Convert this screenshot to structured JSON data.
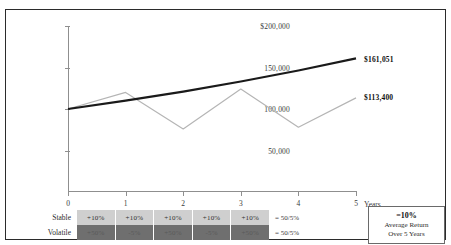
{
  "top_stub_text": "",
  "chart_data": {
    "type": "line",
    "title": "",
    "xlabel": "Years",
    "ylabel": "",
    "x": [
      0,
      1,
      2,
      3,
      4,
      5
    ],
    "xlim": [
      0,
      5
    ],
    "ylim": [
      0,
      200000
    ],
    "grid": false,
    "legend_position": "inline-right",
    "x_tick_labels": [
      "0",
      "1",
      "2",
      "3",
      "4",
      "5"
    ],
    "y_tick_labels": [
      "$200,000",
      "150,000",
      "100,000",
      "50,000"
    ],
    "y_tick_values": [
      200000,
      150000,
      100000,
      50000
    ],
    "series": [
      {
        "name": "Stable",
        "color": "#1a1a1a",
        "values": [
          100000,
          110000,
          121000,
          133100,
          146410,
          161051
        ],
        "end_label": "$161,051",
        "rates": [
          "+10%",
          "+10%",
          "+10%",
          "+10%",
          "+10%"
        ],
        "legend_note": "= 50/5%"
      },
      {
        "name": "Volatile",
        "color": "#b5b5b5",
        "values": [
          100000,
          120000,
          76000,
          124000,
          78000,
          113400
        ],
        "end_label": "$113,400",
        "rates": [
          "+50%",
          "-5%",
          "+50%",
          "-5%",
          "+50%"
        ],
        "legend_note": "= 50/5%"
      }
    ]
  },
  "table": {
    "rows": [
      {
        "label": "Stable",
        "cells": [
          "+10%",
          "+10%",
          "+10%",
          "+10%",
          "+10%"
        ],
        "legend": "= 50/5%"
      },
      {
        "label": "Volatile",
        "cells": [
          "+50%",
          "-5%",
          "+50%",
          "-5%",
          "+50%"
        ],
        "legend": "= 50/5%"
      }
    ]
  },
  "callout": {
    "headline": "=10%",
    "line1": "Average Return",
    "line2": "Over 5 Years"
  }
}
